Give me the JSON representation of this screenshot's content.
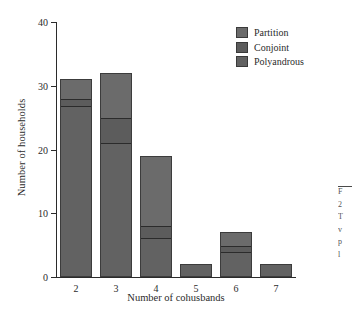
{
  "chart_data": {
    "type": "bar",
    "subtype": "stacked-bar",
    "title": "",
    "xlabel": "Number of cohusbands",
    "ylabel": "Number of households",
    "categories": [
      "2",
      "3",
      "4",
      "5",
      "6",
      "7"
    ],
    "series": [
      {
        "name": "Polyandrous",
        "values": [
          27,
          21,
          6,
          2,
          4,
          2
        ],
        "color": "#626262"
      },
      {
        "name": "Conjoint",
        "values": [
          1,
          4,
          2,
          0,
          1,
          0
        ],
        "color": "#5c5c5c"
      },
      {
        "name": "Partition",
        "values": [
          3,
          7,
          11,
          0,
          2,
          0
        ],
        "color": "#6b6b6b"
      }
    ],
    "totals": [
      31,
      32,
      19,
      2,
      7,
      2
    ],
    "ylim": [
      0,
      40
    ],
    "yticks": [
      0,
      10,
      20,
      30,
      40
    ],
    "xticks": [
      "2",
      "3",
      "4",
      "5",
      "6",
      "7"
    ],
    "grid": false,
    "legend_position": "top-right",
    "legend_entries": [
      {
        "label": "Partition",
        "color": "#6b6b6b"
      },
      {
        "label": "Conjoint",
        "color": "#5c5c5c"
      },
      {
        "label": "Polyandrous",
        "color": "#626262"
      }
    ],
    "axis_color": "#2b2b2b",
    "background": "#ffffff"
  },
  "axes": {
    "ytick_labels": [
      "0",
      "10",
      "20",
      "30",
      "40"
    ],
    "xtick_labels": [
      "2",
      "3",
      "4",
      "5",
      "6",
      "7"
    ],
    "ylabel": "Number of households",
    "xlabel": "Number of cohusbands"
  },
  "legend": {
    "items": [
      {
        "label": "Partition"
      },
      {
        "label": "Conjoint"
      },
      {
        "label": "Polyandrous"
      }
    ]
  },
  "margin_note": {
    "lines": [
      "F",
      "2",
      "T",
      "v",
      "p",
      "l"
    ]
  }
}
